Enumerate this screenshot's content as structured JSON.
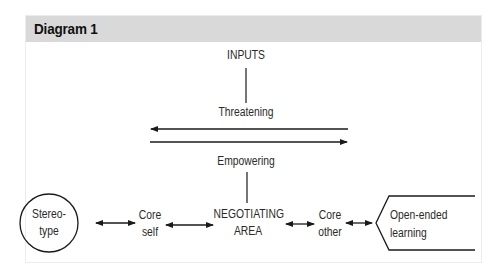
{
  "panel": {
    "title": "Diagram 1",
    "header_color": "#d9d9d9"
  },
  "diagram": {
    "top_label": "INPUTS",
    "upper_label": "Threatening",
    "lower_label": "Empowering",
    "nodes": [
      {
        "id": "stereotype",
        "shape": "circle",
        "line1": "Stereo-",
        "line2": "type"
      },
      {
        "id": "core-self",
        "shape": "none",
        "line1": "Core",
        "line2": "self"
      },
      {
        "id": "negotiating-area",
        "shape": "none",
        "line1": "NEGOTIATING",
        "line2": "AREA"
      },
      {
        "id": "core-other",
        "shape": "none",
        "line1": "Core",
        "line2": "other"
      },
      {
        "id": "open-ended-learning",
        "shape": "open-chevron",
        "line1": "Open-ended",
        "line2": "learning"
      }
    ],
    "connections": [
      {
        "from": "stereotype",
        "to": "core-self",
        "type": "bidirectional"
      },
      {
        "from": "core-self",
        "to": "negotiating-area",
        "type": "bidirectional"
      },
      {
        "from": "negotiating-area",
        "to": "core-other",
        "type": "bidirectional"
      },
      {
        "from": "core-other",
        "to": "open-ended-learning",
        "type": "bidirectional"
      },
      {
        "from": "INPUTS",
        "to": "Threatening",
        "type": "line"
      },
      {
        "from": "Empowering",
        "to": "negotiating-area",
        "type": "line"
      },
      {
        "direction": "leftward",
        "type": "arrow",
        "position": "upper"
      },
      {
        "direction": "rightward",
        "type": "arrow",
        "position": "lower"
      }
    ]
  }
}
